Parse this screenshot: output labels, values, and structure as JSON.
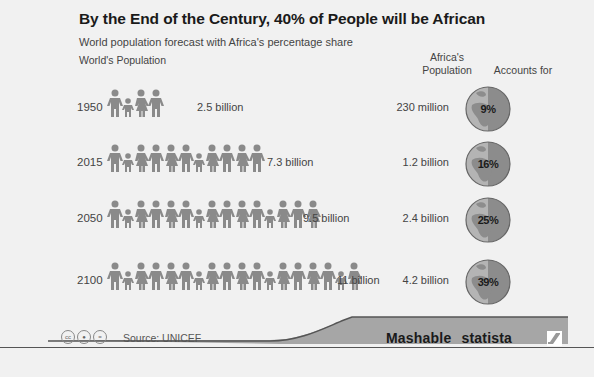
{
  "header": {
    "title": "By the End of the Century, 40% of People will be African",
    "subtitle": "World population forecast with Africa's percentage share"
  },
  "columns": {
    "world": "World's Population",
    "africa": "Africa's Population",
    "africa_line1": "Africa's",
    "africa_line2": "Population",
    "accounts": "Accounts for"
  },
  "rows": [
    {
      "year": "1950",
      "world": "2.5 billion",
      "africa": "230 million",
      "share": "9%",
      "figures": 4
    },
    {
      "year": "2015",
      "world": "7.3 billion",
      "africa": "1.2 billion",
      "share": "16%",
      "figures": 11
    },
    {
      "year": "2050",
      "world": "9.5 billion",
      "africa": "2.4 billion",
      "share": "25%",
      "figures": 15
    },
    {
      "year": "2100",
      "world": "11 billion",
      "africa": "4.2 billion",
      "share": "39%",
      "figures": 18
    }
  ],
  "footer": {
    "source": "Source: UNICEF",
    "brand": "Mashable statista",
    "license_icons": [
      "cc-icon",
      "attribution-icon",
      "no-derivatives-icon"
    ]
  },
  "colors": {
    "background": "#f1f1f1",
    "figure": "#8a8a8a",
    "globe_light": "#b4b4b4",
    "globe_dark": "#8c8c8c",
    "band": "#a6a6a6"
  },
  "chart_data": {
    "type": "table",
    "title": "By the End of the Century, 40% of People will be African",
    "subtitle": "World population forecast with Africa's percentage share",
    "columns": [
      "Year",
      "World's Population",
      "Africa's Population",
      "Accounts for"
    ],
    "categories": [
      "1950",
      "2015",
      "2050",
      "2100"
    ],
    "series": [
      {
        "name": "World's Population (billion)",
        "values": [
          2.5,
          7.3,
          9.5,
          11
        ]
      },
      {
        "name": "Africa's Population (billion)",
        "values": [
          0.23,
          1.2,
          2.4,
          4.2
        ]
      },
      {
        "name": "Africa's share (%)",
        "values": [
          9,
          16,
          25,
          39
        ]
      }
    ],
    "source": "UNICEF"
  }
}
